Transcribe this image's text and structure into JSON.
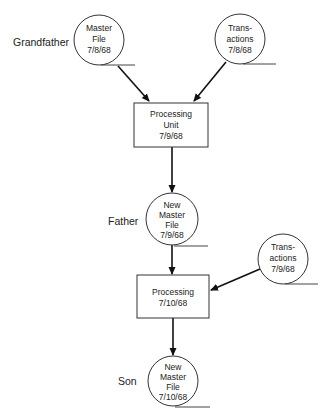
{
  "diagram": {
    "generations": {
      "grandfather": "Grandfather",
      "father": "Father",
      "son": "Son"
    },
    "nodes": {
      "master_file_1": {
        "type": "file-circle",
        "lines": [
          "Master",
          "File",
          "7/8/68"
        ]
      },
      "transactions_1": {
        "type": "file-circle",
        "lines": [
          "Trans-",
          "actions",
          "7/8/68"
        ]
      },
      "processing_1": {
        "type": "process-box",
        "lines": [
          "Processing",
          "Unit",
          "7/9/68"
        ]
      },
      "master_file_2": {
        "type": "file-circle",
        "lines": [
          "New",
          "Master",
          "File",
          "7/9/68"
        ]
      },
      "transactions_2": {
        "type": "file-circle",
        "lines": [
          "Trans-",
          "actions",
          "7/9/68"
        ]
      },
      "processing_2": {
        "type": "process-box",
        "lines": [
          "Processing",
          "7/10/68"
        ]
      },
      "master_file_3": {
        "type": "file-circle",
        "lines": [
          "New",
          "Master",
          "File",
          "7/10/68"
        ]
      }
    },
    "edges": [
      {
        "from": "master_file_1",
        "to": "processing_1"
      },
      {
        "from": "transactions_1",
        "to": "processing_1"
      },
      {
        "from": "processing_1",
        "to": "master_file_2"
      },
      {
        "from": "master_file_2",
        "to": "processing_2"
      },
      {
        "from": "transactions_2",
        "to": "processing_2"
      },
      {
        "from": "processing_2",
        "to": "master_file_3"
      }
    ],
    "colors": {
      "stroke": "#333333",
      "text": "#222222",
      "background": "#ffffff"
    }
  }
}
